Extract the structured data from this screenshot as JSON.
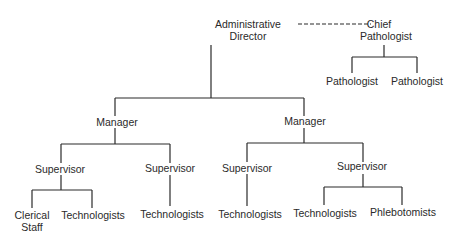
{
  "org_chart": {
    "admin_director": {
      "line1": "Administrative",
      "line2": "Director"
    },
    "chief_pathologist": {
      "line1": "Chief",
      "line2": "Pathologist"
    },
    "pathologists": [
      "Pathologist",
      "Pathologist"
    ],
    "managers": [
      "Manager",
      "Manager"
    ],
    "supervisors": [
      "Supervisor",
      "Supervisor",
      "Supervisor",
      "Supervisor"
    ],
    "staff": {
      "clerical": {
        "line1": "Clerical",
        "line2": "Staff"
      },
      "technologists": [
        "Technologists",
        "Technologists",
        "Technologists",
        "Technologists"
      ],
      "phlebotomists": "Phlebotomists"
    }
  },
  "colors": {
    "line": "#2a2a2a",
    "text": "#2a2a2a",
    "background": "#ffffff"
  }
}
